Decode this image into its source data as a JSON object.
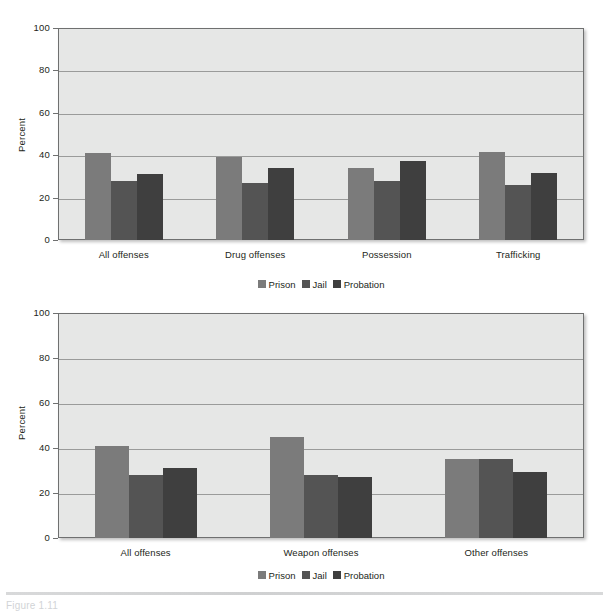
{
  "figure": {
    "caption": "Figure 1.11"
  },
  "legend": {
    "entries": [
      {
        "label": "Prison",
        "color": "#7b7b7b",
        "key": "prison"
      },
      {
        "label": "Jail",
        "color": "#545454",
        "key": "jail"
      },
      {
        "label": "Probation",
        "color": "#3f3f3f",
        "key": "probation"
      }
    ]
  },
  "chart_data": [
    {
      "type": "bar",
      "title": "",
      "xlabel": "",
      "ylabel": "Percent",
      "ylim": [
        0,
        100
      ],
      "yticks": [
        0,
        20,
        40,
        60,
        80,
        100
      ],
      "grid": true,
      "legend_position": "bottom",
      "categories": [
        "All offenses",
        "Drug offenses",
        "Possession",
        "Trafficking"
      ],
      "series": [
        {
          "name": "Prison",
          "color": "#7b7b7b",
          "values": [
            41,
            39,
            34,
            41.5
          ]
        },
        {
          "name": "Jail",
          "color": "#545454",
          "values": [
            28,
            27,
            28,
            26
          ]
        },
        {
          "name": "Probation",
          "color": "#3f3f3f",
          "values": [
            31,
            34,
            37.5,
            31.5
          ]
        }
      ]
    },
    {
      "type": "bar",
      "title": "",
      "xlabel": "",
      "ylabel": "Percent",
      "ylim": [
        0,
        100
      ],
      "yticks": [
        0,
        20,
        40,
        60,
        80,
        100
      ],
      "grid": true,
      "legend_position": "bottom",
      "categories": [
        "All offenses",
        "Weapon offenses",
        "Other offenses"
      ],
      "series": [
        {
          "name": "Prison",
          "color": "#7b7b7b",
          "values": [
            41,
            45,
            35
          ]
        },
        {
          "name": "Jail",
          "color": "#545454",
          "values": [
            28,
            28,
            35
          ]
        },
        {
          "name": "Probation",
          "color": "#3f3f3f",
          "values": [
            31,
            27,
            29.5
          ]
        }
      ]
    }
  ]
}
